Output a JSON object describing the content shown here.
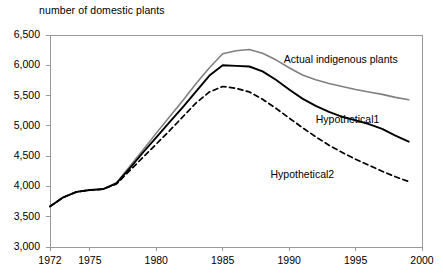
{
  "chart_data": {
    "type": "line",
    "title": "number of domestic plants",
    "xlabel": "",
    "ylabel": "number of domestic plants",
    "xlim": [
      1972,
      2000
    ],
    "ylim": [
      3000,
      6500
    ],
    "ytick_labels": [
      "6,500",
      "6,000",
      "5,500",
      "5,000",
      "4,500",
      "4,000",
      "3,500",
      "3,000"
    ],
    "ytick_values": [
      6500,
      6000,
      5500,
      5000,
      4500,
      4000,
      3500,
      3000
    ],
    "xtick_labels": [
      "1972",
      "1975",
      "1980",
      "1985",
      "1990",
      "1995",
      "2000"
    ],
    "xtick_values": [
      1972,
      1975,
      1980,
      1985,
      1990,
      1995,
      2000
    ],
    "grid": false,
    "legend_position": "inline-annotations",
    "series": [
      {
        "name": "Actual indigenous plants",
        "style": "solid",
        "color": "#808080",
        "width": 1.6,
        "label_x": 1989.6,
        "label_y": 6080,
        "x": [
          1972,
          1973,
          1974,
          1975,
          1976,
          1977,
          1978,
          1979,
          1980,
          1981,
          1982,
          1983,
          1984,
          1985,
          1986,
          1987,
          1988,
          1989,
          1990,
          1991,
          1992,
          1993,
          1994,
          1995,
          1996,
          1997,
          1998,
          1999
        ],
        "y": [
          3670,
          3820,
          3910,
          3940,
          3955,
          4060,
          4330,
          4600,
          4880,
          5150,
          5420,
          5700,
          5960,
          6190,
          6240,
          6260,
          6200,
          6090,
          5960,
          5840,
          5760,
          5700,
          5650,
          5600,
          5560,
          5520,
          5470,
          5430
        ]
      },
      {
        "name": "Hypothetical1",
        "style": "solid",
        "color": "#000000",
        "width": 1.9,
        "label_x": 1992.0,
        "label_y": 5090,
        "x": [
          1972,
          1973,
          1974,
          1975,
          1976,
          1977,
          1978,
          1979,
          1980,
          1981,
          1982,
          1983,
          1984,
          1985,
          1986,
          1987,
          1988,
          1989,
          1990,
          1991,
          1992,
          1993,
          1994,
          1995,
          1996,
          1997,
          1998,
          1999
        ],
        "y": [
          3670,
          3820,
          3910,
          3940,
          3955,
          4050,
          4300,
          4560,
          4810,
          5060,
          5310,
          5570,
          5830,
          6000,
          5990,
          5980,
          5900,
          5760,
          5600,
          5450,
          5330,
          5230,
          5150,
          5090,
          5030,
          4950,
          4840,
          4740
        ]
      },
      {
        "name": "Hypothetical2",
        "style": "dashed",
        "color": "#000000",
        "width": 1.7,
        "label_x": 1988.6,
        "label_y": 4190,
        "x": [
          1972,
          1973,
          1974,
          1975,
          1976,
          1977,
          1978,
          1979,
          1980,
          1981,
          1982,
          1983,
          1984,
          1985,
          1986,
          1987,
          1988,
          1989,
          1990,
          1991,
          1992,
          1993,
          1994,
          1995,
          1996,
          1997,
          1998,
          1999
        ],
        "y": [
          3670,
          3820,
          3910,
          3940,
          3955,
          4040,
          4260,
          4480,
          4700,
          4920,
          5150,
          5380,
          5560,
          5650,
          5620,
          5560,
          5440,
          5290,
          5130,
          4970,
          4820,
          4680,
          4560,
          4450,
          4350,
          4250,
          4160,
          4080
        ]
      }
    ]
  },
  "axis": {
    "frame_color": "#999999",
    "tick_color": "#999999"
  }
}
